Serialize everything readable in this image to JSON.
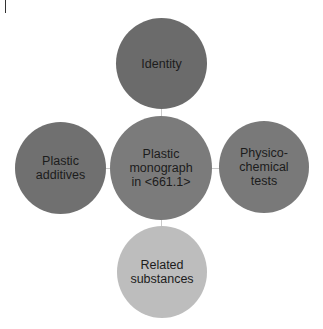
{
  "diagram": {
    "type": "hub-and-spoke",
    "center": {
      "label": "Plastic\nmonograph\nin <661.1>",
      "color": "#7b7b7b"
    },
    "nodes": [
      {
        "id": "top",
        "label": "Identity",
        "color": "#6b6b6b"
      },
      {
        "id": "left",
        "label": "Plastic\nadditives",
        "color": "#707070"
      },
      {
        "id": "right",
        "label": "Physico-\nchemical\ntests",
        "color": "#797979"
      },
      {
        "id": "bottom",
        "label": "Related\nsubstances",
        "color": "#bdbdbd"
      }
    ],
    "connector_color": "#c9c9c9"
  }
}
